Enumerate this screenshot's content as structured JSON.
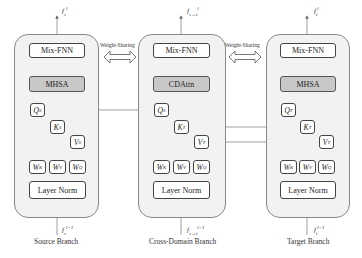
{
  "diagram": {
    "weight_sharing_label": "Weight-Sharing",
    "branches": [
      {
        "id": "source",
        "caption": "Source Branch",
        "output_label": "f_s^l",
        "input_label": "f_s^{l-1}",
        "mix_ffn": "Mix-FNN",
        "attention": "MHSA",
        "q": "Q",
        "q_sup": "S",
        "k": "K",
        "k_sup": "S",
        "v": "V",
        "v_sup": "S",
        "weights": [
          {
            "w": "W",
            "sup": "K"
          },
          {
            "w": "W",
            "sup": "V"
          },
          {
            "w": "W",
            "sup": "Q"
          }
        ],
        "layer_norm": "Layer Norm"
      },
      {
        "id": "cross",
        "caption": "Cross-Domain Branch",
        "output_label": "f_{s→t}^l",
        "input_label": "f_{s→t}^{l-1}",
        "mix_ffn": "Mix-FNN",
        "attention": "CDAttn",
        "q": "Q",
        "q_sup": "S",
        "k": "K",
        "k_sup": "T",
        "v": "V",
        "v_sup": "T",
        "weights": [
          {
            "w": "W",
            "sup": "K"
          },
          {
            "w": "W",
            "sup": "V"
          },
          {
            "w": "W",
            "sup": "Q"
          }
        ],
        "layer_norm": "Layer Norm"
      },
      {
        "id": "target",
        "caption": "Target Branch",
        "output_label": "f_t^l",
        "input_label": "f_t^{l-1}",
        "mix_ffn": "Mix-FNN",
        "attention": "MHSA",
        "q": "Q",
        "q_sup": "T",
        "k": "K",
        "k_sup": "T",
        "v": "V",
        "v_sup": "T",
        "weights": [
          {
            "w": "W",
            "sup": "K"
          },
          {
            "w": "W",
            "sup": "V"
          },
          {
            "w": "W",
            "sup": "Q"
          }
        ],
        "layer_norm": "Layer Norm"
      }
    ],
    "connections": [
      {
        "from": "source.Q^S",
        "to": "cross.Q^S"
      },
      {
        "from": "target.K^T",
        "to": "cross.K^T"
      },
      {
        "from": "target.V^T",
        "to": "cross.V^T"
      }
    ]
  }
}
